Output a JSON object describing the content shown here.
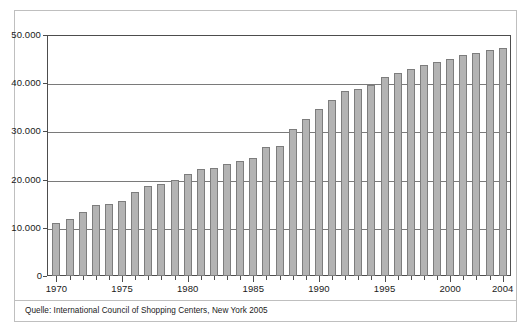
{
  "chart_data": {
    "type": "bar",
    "title": "",
    "subtitle": "",
    "xlabel": "",
    "ylabel": "",
    "ylim": [
      0,
      50000
    ],
    "grid": true,
    "legend": null,
    "number_format": "german-thousands-dot",
    "y_ticks": [
      0,
      10000,
      20000,
      30000,
      40000,
      50000
    ],
    "y_tick_labels": [
      "0",
      "10.000",
      "20.000",
      "30.000",
      "40.000",
      "50.000"
    ],
    "x_tick_labels": [
      "1970",
      "1975",
      "1980",
      "1985",
      "1990",
      "1995",
      "2000",
      "2004"
    ],
    "categories": [
      "1970",
      "1971",
      "1972",
      "1973",
      "1974",
      "1975",
      "1976",
      "1977",
      "1978",
      "1979",
      "1980",
      "1981",
      "1982",
      "1983",
      "1984",
      "1985",
      "1986",
      "1987",
      "1988",
      "1989",
      "1990",
      "1991",
      "1992",
      "1993",
      "1994",
      "1995",
      "1996",
      "1997",
      "1998",
      "1999",
      "2000",
      "2001",
      "2002",
      "2003",
      "2004"
    ],
    "values": [
      10900,
      11900,
      13200,
      14700,
      15000,
      15600,
      17500,
      18600,
      19100,
      19900,
      21100,
      22100,
      22400,
      23200,
      23800,
      24500,
      26700,
      26900,
      30600,
      32600,
      34700,
      36500,
      38300,
      38900,
      39600,
      41200,
      42100,
      43000,
      43700,
      44400,
      45100,
      45800,
      46300,
      46900,
      47400
    ]
  },
  "caption": {
    "source_text": "Quelle: International Council of Shopping Centers, New York 2005"
  }
}
